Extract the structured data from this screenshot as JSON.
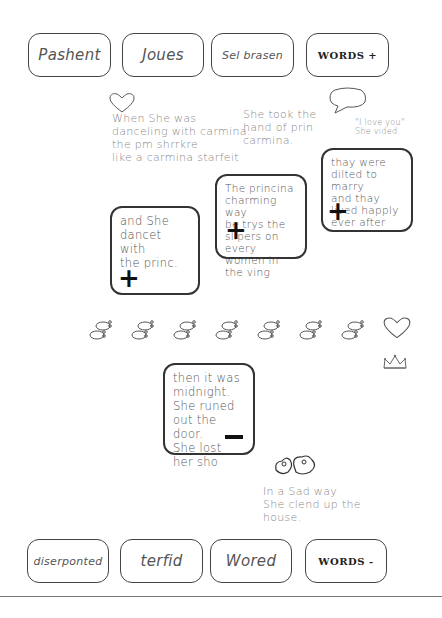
{
  "top_bar": {
    "words": [
      "Pashent",
      "Joues",
      "Sel brasen"
    ],
    "control_label": "WORDS +"
  },
  "bottom_bar": {
    "words": [
      "diserponted",
      "terfid",
      "Wored"
    ],
    "control_label": "WORDS -"
  },
  "floating_texts": [
    {
      "text": "When She was\ndanceling with carmina.\nthe pm shrrkre\nlike a carmina starfeit"
    },
    {
      "text": "She took the\nhand of prin\ncarmina."
    },
    {
      "text": "\"I love you\"\nShe vided."
    },
    {
      "text": "In a Sad way\nShe clend up the\nhouse."
    }
  ],
  "cards": [
    {
      "text": "and She\ndancet with\nthe princ.",
      "action": "add"
    },
    {
      "text": "The princina\ncharming way\nbe trys the\nslipers on every\nwomen in\nthe ving",
      "action": "add"
    },
    {
      "text": "thay were\ndilted to marry\nand thay\nlived happly\never after",
      "action": "add"
    },
    {
      "text": "then it was\nmidnight.\nShe runed\nout the door.\nShe lost her sho",
      "action": "remove"
    }
  ],
  "icons": {
    "footprints_count": 7,
    "heart": "heart-icon",
    "speech_bubble": "speech-bubble-icon",
    "crown": "crown-icon",
    "mice": "mice-drawing-icon"
  },
  "colors": {
    "border": "#333333",
    "text": "#555555",
    "background": "#ffffff"
  }
}
